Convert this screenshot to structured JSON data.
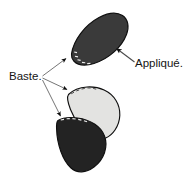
{
  "diagram": {
    "background_color": "#ffffff",
    "labels": {
      "applique": "Appliqué.",
      "baste": "Baste."
    },
    "colors": {
      "dark_petal": "#3a3a3a",
      "darker_petal": "#232323",
      "light_petal": "#e3e3e1",
      "outline": "#0f0f0f",
      "leader_line": "#6e6e6e",
      "text": "#141414",
      "stitch": "#f2f2f2"
    },
    "shapes": [
      {
        "name": "top-dark-petal",
        "fill": "#3a3a3a",
        "description": "upper dark appliqué petal, tipped to the right",
        "basted_edge": "lower-left"
      },
      {
        "name": "middle-light-petal",
        "fill": "#e3e3e1",
        "description": "middle light gray appliqué petal",
        "basted_edge": "upper-left"
      },
      {
        "name": "bottom-dark-petal",
        "fill": "#232323",
        "description": "lower dark appliqué petal overlapping the light petal",
        "basted_edge": "top"
      }
    ],
    "annotations": [
      {
        "name": "applique-callout",
        "label": "Appliqué.",
        "points_to": "top-dark-petal",
        "arrow_direction": "up-left"
      },
      {
        "name": "baste-callout",
        "label": "Baste.",
        "points_to": [
          "top-dark-petal",
          "middle-light-petal",
          "bottom-dark-petal"
        ],
        "arrow_count": 3,
        "arrow_direction": "right"
      }
    ]
  }
}
